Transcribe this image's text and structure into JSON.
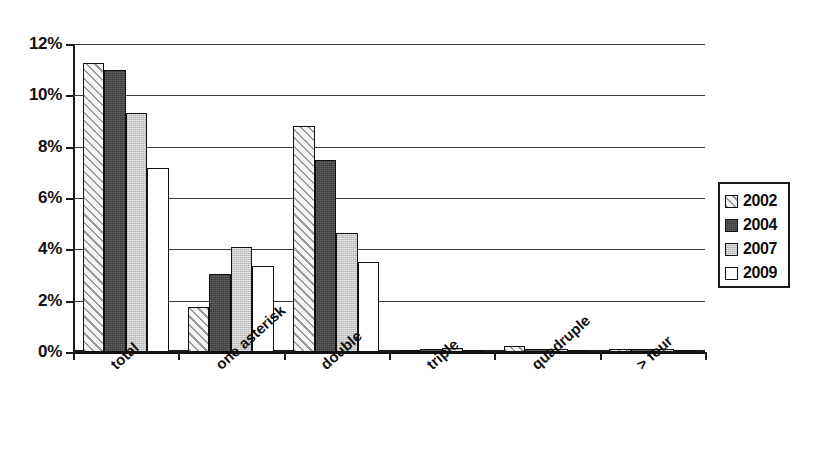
{
  "chart_data": {
    "type": "bar",
    "title": "",
    "subtitle": "",
    "xlabel": "",
    "ylabel": "",
    "ylim": [
      0,
      12
    ],
    "ytick_step": 2,
    "ytick_labels": [
      "0%",
      "2%",
      "4%",
      "6%",
      "8%",
      "10%",
      "12%"
    ],
    "ytick_values": [
      0,
      2,
      4,
      6,
      8,
      10,
      12
    ],
    "grid": true,
    "grid_axis": "y",
    "legend_position": "right",
    "value_unit": "%",
    "categories": [
      "total",
      "one asterisk",
      "double",
      "triple",
      "quadruple",
      "> four"
    ],
    "series": [
      {
        "name": "2002",
        "pattern": "diagonal-hatch",
        "color": "#f2f2f2",
        "values": [
          11.25,
          1.75,
          8.8,
          0.08,
          0.25,
          0.1
        ]
      },
      {
        "name": "2004",
        "pattern": "solid-dark",
        "color": "#3b3b3b",
        "values": [
          11.0,
          3.05,
          7.5,
          0.1,
          0.12,
          0.1
        ]
      },
      {
        "name": "2007",
        "pattern": "solid-light",
        "color": "#c8c8c8",
        "values": [
          9.3,
          4.1,
          4.65,
          0.15,
          0.12,
          0.1
        ]
      },
      {
        "name": "2009",
        "pattern": "solid-white",
        "color": "#ffffff",
        "values": [
          7.15,
          3.35,
          3.5,
          0.05,
          0.05,
          0.08
        ]
      }
    ]
  }
}
